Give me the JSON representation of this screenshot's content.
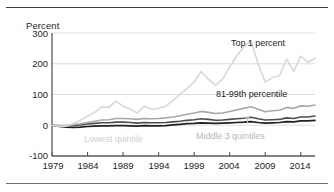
{
  "axis_unit_label": "Percent",
  "yticks": [
    "300",
    "200",
    "100",
    "0",
    "-100"
  ],
  "xticks": [
    "1979",
    "1984",
    "1989",
    "1994",
    "1999",
    "2004",
    "2009",
    "2014"
  ],
  "series_labels": {
    "top1": "Top 1 percent",
    "p8199": "81-99th percentile",
    "middle3": "Middle 3 quintiles",
    "lowest": "Lowest quintile"
  },
  "colors": {
    "top1": "#231f20",
    "p8199": "#4d4d4d",
    "middle3": "#a8a8a8",
    "lowest": "#d8d8d8",
    "grid": "#d9d9d9",
    "axis": "#58585a"
  },
  "chart_data": {
    "type": "line",
    "title": "",
    "xlabel": "",
    "ylabel": "Percent",
    "xlim": [
      1979,
      2016
    ],
    "ylim": [
      -100,
      300
    ],
    "yticks": [
      -100,
      0,
      100,
      200,
      300
    ],
    "xticks": [
      1979,
      1984,
      1989,
      1994,
      1999,
      2004,
      2009,
      2014
    ],
    "grid": "horizontal",
    "legend": "inline-annotations",
    "x": [
      1979,
      1980,
      1981,
      1982,
      1983,
      1984,
      1985,
      1986,
      1987,
      1988,
      1989,
      1990,
      1991,
      1992,
      1993,
      1994,
      1995,
      1996,
      1997,
      1998,
      1999,
      2000,
      2001,
      2002,
      2003,
      2004,
      2005,
      2006,
      2007,
      2008,
      2009,
      2010,
      2011,
      2012,
      2013,
      2014,
      2015,
      2016
    ],
    "series": [
      {
        "name": "Top 1 percent",
        "values": [
          0,
          -4,
          -3,
          6,
          16,
          30,
          42,
          60,
          58,
          78,
          62,
          52,
          40,
          62,
          52,
          55,
          62,
          80,
          100,
          120,
          140,
          175,
          150,
          130,
          150,
          190,
          225,
          255,
          275,
          200,
          140,
          155,
          160,
          215,
          175,
          225,
          205,
          218
        ]
      },
      {
        "name": "81-99th percentile",
        "values": [
          0,
          -1,
          0,
          2,
          5,
          9,
          13,
          17,
          18,
          22,
          22,
          21,
          19,
          22,
          21,
          22,
          24,
          27,
          31,
          36,
          40,
          45,
          42,
          38,
          40,
          45,
          50,
          55,
          60,
          52,
          44,
          47,
          49,
          58,
          55,
          63,
          62,
          66
        ]
      },
      {
        "name": "Middle 3 quintiles",
        "values": [
          0,
          -2,
          -2,
          -1,
          1,
          4,
          6,
          8,
          8,
          10,
          10,
          9,
          7,
          9,
          8,
          8,
          9,
          11,
          13,
          16,
          18,
          21,
          19,
          16,
          17,
          19,
          21,
          23,
          26,
          21,
          17,
          18,
          19,
          24,
          22,
          27,
          27,
          30
        ]
      },
      {
        "name": "Lowest quintile",
        "values": [
          0,
          -4,
          -6,
          -7,
          -6,
          -4,
          -3,
          -2,
          -2,
          -1,
          -1,
          -2,
          -3,
          -1,
          -2,
          -2,
          -1,
          1,
          3,
          5,
          6,
          8,
          7,
          6,
          7,
          8,
          9,
          10,
          12,
          9,
          7,
          8,
          9,
          12,
          11,
          14,
          14,
          16
        ]
      }
    ]
  }
}
